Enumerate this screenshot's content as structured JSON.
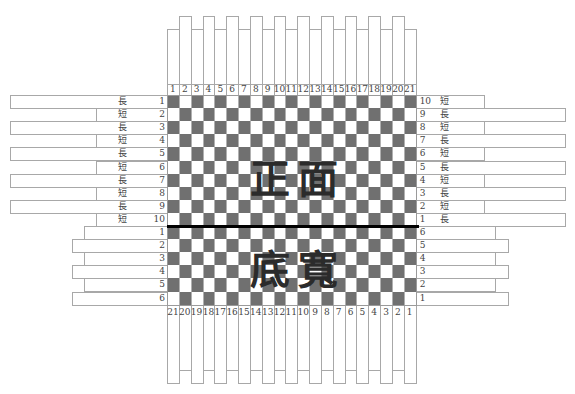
{
  "diagram": {
    "title_top": "正面",
    "title_bottom": "底寬",
    "grid": {
      "columns": 21,
      "rows_top": 10,
      "rows_bottom": 6,
      "dark_color": "#707070",
      "light_color": "#ffffff",
      "divider_color": "#000000"
    },
    "top_column_labels": [
      "1",
      "2",
      "3",
      "4",
      "5",
      "6",
      "7",
      "8",
      "9",
      "10",
      "11",
      "12",
      "13",
      "14",
      "15",
      "16",
      "17",
      "18",
      "19",
      "20",
      "21"
    ],
    "bottom_column_labels": [
      "21",
      "20",
      "19",
      "18",
      "17",
      "16",
      "15",
      "14",
      "13",
      "12",
      "11",
      "10",
      "9",
      "8",
      "7",
      "6",
      "5",
      "4",
      "3",
      "2",
      "1"
    ],
    "left_top_rows": [
      {
        "num": "1",
        "kind": "長"
      },
      {
        "num": "2",
        "kind": "短"
      },
      {
        "num": "3",
        "kind": "長"
      },
      {
        "num": "4",
        "kind": "短"
      },
      {
        "num": "5",
        "kind": "長"
      },
      {
        "num": "6",
        "kind": "短"
      },
      {
        "num": "7",
        "kind": "長"
      },
      {
        "num": "8",
        "kind": "短"
      },
      {
        "num": "9",
        "kind": "長"
      },
      {
        "num": "10",
        "kind": "短"
      }
    ],
    "right_top_rows": [
      {
        "num": "10",
        "kind": "短"
      },
      {
        "num": "9",
        "kind": "長"
      },
      {
        "num": "8",
        "kind": "短"
      },
      {
        "num": "7",
        "kind": "長"
      },
      {
        "num": "6",
        "kind": "短"
      },
      {
        "num": "5",
        "kind": "長"
      },
      {
        "num": "4",
        "kind": "短"
      },
      {
        "num": "3",
        "kind": "長"
      },
      {
        "num": "2",
        "kind": "短"
      },
      {
        "num": "1",
        "kind": "長"
      }
    ],
    "left_bottom_rows": [
      "1",
      "2",
      "3",
      "4",
      "5",
      "6"
    ],
    "right_bottom_rows": [
      "6",
      "5",
      "4",
      "3",
      "2",
      "1"
    ]
  }
}
